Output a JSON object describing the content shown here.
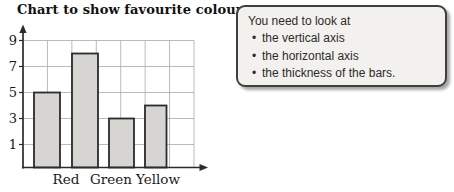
{
  "chart": {
    "title": "Chart to show favourite colour"
  },
  "chart_data": {
    "type": "bar",
    "title": "Chart to show favourite colour",
    "xlabel": "",
    "ylabel": "",
    "y_ticks": [
      9,
      7,
      5,
      3,
      1
    ],
    "categories": [
      "Red",
      "Green",
      "",
      "Yellow"
    ],
    "values": [
      5,
      8,
      3,
      4
    ],
    "bars": [
      {
        "label": "Red",
        "value": 5,
        "x_px": 34,
        "width_px": 26
      },
      {
        "label": "Green",
        "value": 8,
        "x_px": 72,
        "width_px": 26
      },
      {
        "label": "",
        "value": 3,
        "x_px": 109,
        "width_px": 25
      },
      {
        "label": "Yellow",
        "value": 4,
        "x_px": 145,
        "width_px": 21.5
      }
    ],
    "x_tick_labels": [
      {
        "text": "Red",
        "center_px": 66
      },
      {
        "text": "Green",
        "center_px": 111
      },
      {
        "text": "Yellow",
        "center_px": 158
      }
    ],
    "grid": true,
    "colors": {
      "bar_fill": "#d6d5d2",
      "bar_border": "#2b2b2b",
      "gridline": "#a9a9a9",
      "axis": "#2b2b2b",
      "text": "#1a1a1a"
    }
  },
  "callout": {
    "intro": "You need to look at",
    "bullet_glyph": "•",
    "bullets": [
      "the vertical axis",
      "the horizontal axis",
      "the thickness of the bars."
    ]
  }
}
